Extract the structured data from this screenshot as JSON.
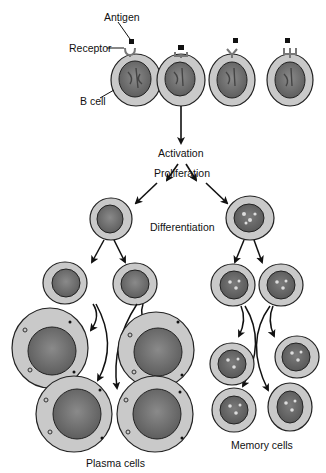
{
  "diagram": {
    "labels": {
      "antigen": "Antigen",
      "receptor": "Receptor",
      "b_cell": "B cell",
      "activation": "Activation",
      "proliferation": "Proliferation",
      "differentiation": "Differentiation",
      "plasma_cells": "Plasma cells",
      "memory_cells": "Memory cells"
    },
    "stages": [
      "Activation",
      "Proliferation",
      "Differentiation"
    ],
    "top_row_b_cells": [
      {
        "receptor_type": "cup",
        "antigen_bound": false
      },
      {
        "receptor_type": "square-cup",
        "antigen_bound": true
      },
      {
        "receptor_type": "Y",
        "antigen_bound": false
      },
      {
        "receptor_type": "trident",
        "antigen_bound": false
      }
    ],
    "outputs": {
      "left_branch": "Plasma cells",
      "right_branch": "Memory cells",
      "plasma_cell_count": 4,
      "memory_cell_count": 4
    },
    "colors": {
      "cytoplasm": "#c8c8c8",
      "nucleus": "#6e6e6e",
      "outline": "#222222",
      "arrow": "#111111",
      "text": "#111111"
    }
  }
}
